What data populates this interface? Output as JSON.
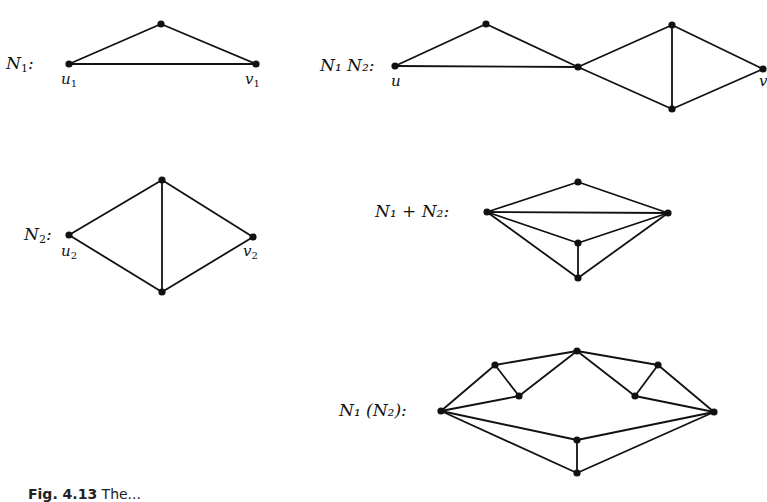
{
  "figure": {
    "caption_label": "Fig. 4.13",
    "caption_text": "The..."
  },
  "networks": [
    {
      "id": "N1",
      "label_main": "N",
      "label_sub": "1",
      "label_suffix": ":",
      "terminals": [
        {
          "name": "u",
          "sub": "1"
        },
        {
          "name": "v",
          "sub": "1"
        }
      ],
      "nodes": [
        [
          69,
          64
        ],
        [
          161,
          24
        ],
        [
          256,
          64
        ]
      ],
      "edges": [
        [
          0,
          1
        ],
        [
          1,
          2
        ],
        [
          0,
          2
        ]
      ]
    },
    {
      "id": "N2",
      "label_main": "N",
      "label_sub": "2",
      "label_suffix": ":",
      "terminals": [
        {
          "name": "u",
          "sub": "2"
        },
        {
          "name": "v",
          "sub": "2"
        }
      ],
      "nodes": [
        [
          69,
          235
        ],
        [
          162,
          180
        ],
        [
          162,
          292
        ],
        [
          253,
          237
        ]
      ],
      "edges": [
        [
          0,
          1
        ],
        [
          0,
          2
        ],
        [
          1,
          2
        ],
        [
          1,
          3
        ],
        [
          2,
          3
        ]
      ]
    },
    {
      "id": "N1N2",
      "label_text": "N₁ N₂:",
      "terminals": [
        {
          "name": "u"
        },
        {
          "name": "v"
        }
      ],
      "nodes": [
        [
          395,
          66
        ],
        [
          486,
          24
        ],
        [
          578,
          67
        ],
        [
          672,
          25
        ],
        [
          672,
          109
        ],
        [
          763,
          69
        ]
      ],
      "edges": [
        [
          0,
          1
        ],
        [
          1,
          2
        ],
        [
          0,
          2
        ],
        [
          2,
          3
        ],
        [
          2,
          4
        ],
        [
          3,
          4
        ],
        [
          3,
          5
        ],
        [
          4,
          5
        ]
      ]
    },
    {
      "id": "N1plusN2",
      "label_text": "N₁ + N₂:",
      "nodes": [
        [
          487,
          212
        ],
        [
          578,
          182
        ],
        [
          668,
          213
        ],
        [
          578,
          243
        ],
        [
          578,
          278
        ]
      ],
      "edges": [
        [
          0,
          1
        ],
        [
          1,
          2
        ],
        [
          0,
          2
        ],
        [
          0,
          3
        ],
        [
          3,
          2
        ],
        [
          0,
          4
        ],
        [
          4,
          2
        ],
        [
          3,
          4
        ]
      ]
    },
    {
      "id": "N1ofN2",
      "label_text": "N₁ (N₂):",
      "nodes": [
        [
          441,
          411
        ],
        [
          495,
          365
        ],
        [
          519,
          396
        ],
        [
          577,
          351
        ],
        [
          635,
          396
        ],
        [
          658,
          365
        ],
        [
          714,
          412
        ],
        [
          577,
          440
        ],
        [
          577,
          473
        ]
      ],
      "edges": [
        [
          0,
          1
        ],
        [
          0,
          2
        ],
        [
          1,
          2
        ],
        [
          1,
          3
        ],
        [
          2,
          3
        ],
        [
          3,
          4
        ],
        [
          3,
          5
        ],
        [
          4,
          5
        ],
        [
          4,
          6
        ],
        [
          5,
          6
        ],
        [
          0,
          7
        ],
        [
          7,
          6
        ],
        [
          0,
          8
        ],
        [
          8,
          6
        ],
        [
          7,
          8
        ]
      ]
    }
  ]
}
